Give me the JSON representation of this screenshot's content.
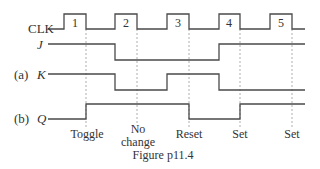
{
  "diagram": {
    "type": "timing_diagram",
    "signals": [
      {
        "name": "CLK",
        "prefix": "",
        "italic": false
      },
      {
        "name": "J",
        "prefix": "",
        "italic": true
      },
      {
        "name": "K",
        "prefix": "(a)",
        "italic": true
      },
      {
        "name": "Q",
        "prefix": "(b)",
        "italic": true
      }
    ],
    "clock_pulses": [
      "1",
      "2",
      "3",
      "4",
      "5"
    ],
    "annotations": [
      {
        "text_line1": "Toggle",
        "text_line2": ""
      },
      {
        "text_line1": "No",
        "text_line2": "change"
      },
      {
        "text_line1": "Reset",
        "text_line2": ""
      },
      {
        "text_line1": "Set",
        "text_line2": ""
      },
      {
        "text_line1": "Set",
        "text_line2": ""
      }
    ],
    "caption": "Figure p11.4",
    "colors": {
      "line": "#4a4a4a",
      "dashed": "#9a9a9a",
      "text": "#333333"
    }
  }
}
